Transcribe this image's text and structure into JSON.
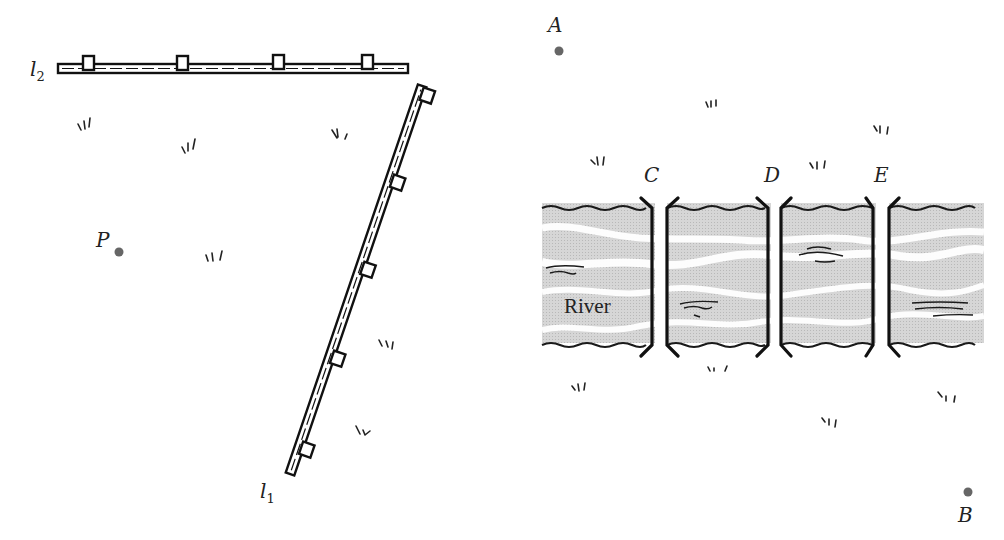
{
  "left_figure": {
    "lines": [
      {
        "label": "l",
        "subscript": "2",
        "description": "horizontal fence with posts",
        "from": [
          58,
          68
        ],
        "to": [
          408,
          68
        ],
        "posts": 4
      },
      {
        "label": "l",
        "subscript": "1",
        "description": "slanted fence with posts",
        "from": [
          290,
          472
        ],
        "to": [
          425,
          85
        ],
        "posts": 5
      }
    ],
    "points": [
      {
        "label": "P",
        "x": 119,
        "y": 252
      }
    ]
  },
  "right_figure": {
    "river_label": "River",
    "points": [
      {
        "label": "A",
        "x": 559,
        "y": 51
      },
      {
        "label": "B",
        "x": 968,
        "y": 492
      }
    ],
    "bridges": [
      {
        "label": "C"
      },
      {
        "label": "D"
      },
      {
        "label": "E"
      }
    ]
  },
  "colors": {
    "ink": "#1a1a1a",
    "point": "#666666",
    "river": "#d2d2d2",
    "river_highlight": "#ffffff"
  }
}
